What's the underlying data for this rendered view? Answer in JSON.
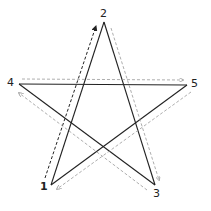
{
  "diagram": {
    "title": "",
    "vertices": [
      {
        "id": "1",
        "label": "1",
        "x": 51,
        "y": 185,
        "lx": 40,
        "ly": 186
      },
      {
        "id": "2",
        "label": "2",
        "x": 104,
        "y": 22,
        "lx": 100,
        "ly": 8
      },
      {
        "id": "3",
        "label": "3",
        "x": 155,
        "y": 185,
        "lx": 155,
        "ly": 190
      },
      {
        "id": "4",
        "label": "4",
        "x": 19,
        "y": 84,
        "lx": 8,
        "ly": 76
      },
      {
        "id": "5",
        "label": "5",
        "x": 187,
        "y": 85,
        "lx": 191,
        "ly": 78
      }
    ],
    "star_edges": [
      [
        "1",
        "2"
      ],
      [
        "2",
        "3"
      ],
      [
        "3",
        "4"
      ],
      [
        "4",
        "5"
      ],
      [
        "5",
        "1"
      ]
    ],
    "stroke_color": "#222222",
    "arrow_color": "#999999",
    "drawing_order": [
      "1",
      "2",
      "3",
      "4",
      "5",
      "1"
    ]
  }
}
